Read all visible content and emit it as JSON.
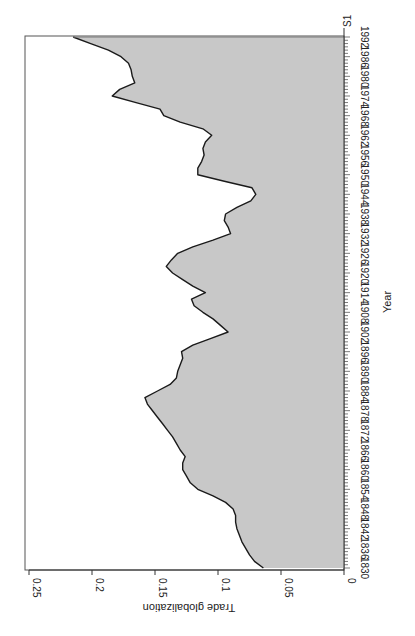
{
  "chart_data": {
    "type": "area",
    "orientation": "rotated-90-ccw",
    "title": "",
    "series_label": "S1",
    "xlabel": "Year",
    "ylabel": "Trade globalization",
    "xlim": [
      1830,
      1992
    ],
    "ylim": [
      0,
      0.25
    ],
    "grid": false,
    "legend": false,
    "fill_color": "#c8c8c8",
    "line_color": "#1a1a1a",
    "x_ticks": [
      1830,
      1836,
      1842,
      1848,
      1854,
      1860,
      1866,
      1872,
      1878,
      1884,
      1890,
      1896,
      1902,
      1908,
      1914,
      1920,
      1926,
      1932,
      1938,
      1944,
      1950,
      1956,
      1962,
      1968,
      1974,
      1980,
      1986,
      1992
    ],
    "y_ticks": [
      0,
      0.05,
      0.1,
      0.15,
      0.2,
      0.25
    ],
    "y_tick_labels": [
      "0",
      "0.05",
      "0.1",
      "0.15",
      "0.2",
      "0.25"
    ],
    "x": [
      1830,
      1832,
      1834,
      1836,
      1838,
      1840,
      1842,
      1844,
      1846,
      1848,
      1850,
      1852,
      1854,
      1856,
      1858,
      1860,
      1862,
      1864,
      1866,
      1868,
      1870,
      1872,
      1874,
      1876,
      1878,
      1880,
      1882,
      1884,
      1886,
      1888,
      1890,
      1892,
      1894,
      1896,
      1898,
      1900,
      1902,
      1904,
      1906,
      1908,
      1910,
      1912,
      1914,
      1916,
      1918,
      1920,
      1922,
      1924,
      1926,
      1928,
      1930,
      1932,
      1934,
      1936,
      1938,
      1940,
      1942,
      1944,
      1946,
      1948,
      1950,
      1952,
      1954,
      1956,
      1958,
      1960,
      1962,
      1964,
      1966,
      1968,
      1970,
      1972,
      1974,
      1976,
      1978,
      1980,
      1982,
      1984,
      1986,
      1988,
      1990,
      1992
    ],
    "values": [
      0.064,
      0.071,
      0.075,
      0.078,
      0.081,
      0.083,
      0.085,
      0.086,
      0.086,
      0.088,
      0.094,
      0.104,
      0.116,
      0.122,
      0.125,
      0.128,
      0.128,
      0.126,
      0.13,
      0.133,
      0.136,
      0.14,
      0.144,
      0.148,
      0.152,
      0.156,
      0.158,
      0.148,
      0.138,
      0.133,
      0.132,
      0.13,
      0.128,
      0.129,
      0.12,
      0.106,
      0.092,
      0.098,
      0.104,
      0.112,
      0.119,
      0.121,
      0.11,
      0.12,
      0.128,
      0.136,
      0.141,
      0.137,
      0.132,
      0.12,
      0.104,
      0.09,
      0.092,
      0.095,
      0.094,
      0.085,
      0.074,
      0.07,
      0.073,
      0.095,
      0.116,
      0.116,
      0.113,
      0.111,
      0.112,
      0.11,
      0.105,
      0.112,
      0.13,
      0.143,
      0.146,
      0.165,
      0.184,
      0.178,
      0.166,
      0.168,
      0.169,
      0.171,
      0.177,
      0.187,
      0.201,
      0.215
    ]
  }
}
